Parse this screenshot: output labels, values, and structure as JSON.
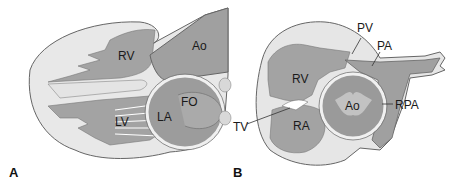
{
  "figure": {
    "panels": [
      {
        "id": "A",
        "panel_label": "A",
        "structures": [
          "RV",
          "Ao",
          "FO",
          "LA",
          "LV"
        ]
      },
      {
        "id": "B",
        "panel_label": "B",
        "structures": [
          "PV",
          "PA",
          "RV",
          "Ao",
          "RPA",
          "TV",
          "RA"
        ]
      }
    ],
    "colors": {
      "background": "#ffffff",
      "tissue_light": "#e6e6e6",
      "chamber_gray": "#9a9a9a",
      "outline": "#555555"
    }
  }
}
